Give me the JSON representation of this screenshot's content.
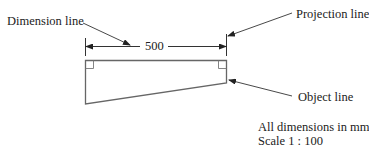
{
  "diagram": {
    "labels": {
      "dimension_line": "Dimension line",
      "projection_line": "Projection line",
      "object_line": "Object line"
    },
    "dimension_value": "500",
    "notes": {
      "units": "All dimensions in mm",
      "scale": "Scale 1 : 100"
    },
    "colors": {
      "line": "#333333",
      "object_line": "#666666",
      "text": "#222222",
      "background": "#ffffff"
    }
  }
}
